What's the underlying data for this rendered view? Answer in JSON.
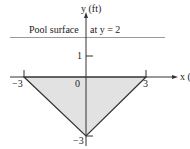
{
  "diagram": {
    "y_axis_label": "y (ft)",
    "x_axis_label": "x (ft)",
    "surface_label_left": "Pool surface",
    "surface_label_right": "at y = 2",
    "ticks": {
      "y_one": "1",
      "origin": "0",
      "x_neg": "−3",
      "x_pos": "3",
      "y_neg": "−3"
    },
    "colors": {
      "fill": "#e2e2e2",
      "line": "#333333",
      "surface": "#9a9a9a"
    }
  }
}
